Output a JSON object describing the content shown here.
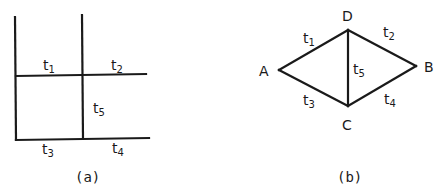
{
  "figure_a": {
    "caption": "(a)",
    "labels": [
      {
        "id": "t1",
        "base": "t",
        "sub": "1"
      },
      {
        "id": "t2",
        "base": "t",
        "sub": "2"
      },
      {
        "id": "t5",
        "base": "t",
        "sub": "5"
      },
      {
        "id": "t3",
        "base": "t",
        "sub": "3"
      },
      {
        "id": "t4",
        "base": "t",
        "sub": "4"
      }
    ]
  },
  "figure_b": {
    "caption": "(b)",
    "nodes": {
      "A": "A",
      "B": "B",
      "C": "C",
      "D": "D"
    },
    "edges": [
      {
        "id": "t1",
        "base": "t",
        "sub": "1",
        "from": "A",
        "to": "D"
      },
      {
        "id": "t2",
        "base": "t",
        "sub": "2",
        "from": "D",
        "to": "B"
      },
      {
        "id": "t3",
        "base": "t",
        "sub": "3",
        "from": "A",
        "to": "C"
      },
      {
        "id": "t4",
        "base": "t",
        "sub": "4",
        "from": "C",
        "to": "B"
      },
      {
        "id": "t5",
        "base": "t",
        "sub": "5",
        "from": "D",
        "to": "C"
      }
    ]
  }
}
